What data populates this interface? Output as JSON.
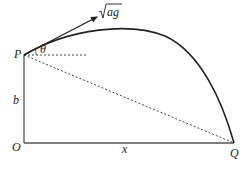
{
  "diagram": {
    "labels": {
      "P": "P",
      "O": "O",
      "Q": "Q",
      "b": "b",
      "x": "x",
      "theta": "θ",
      "velocity": "ag"
    },
    "colors": {
      "line": "#222222",
      "axis": "#555555",
      "dotted": "#444444"
    }
  }
}
